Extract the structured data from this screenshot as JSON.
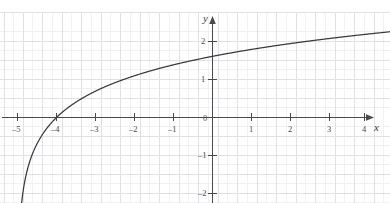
{
  "chart_data": {
    "type": "line",
    "title": "",
    "subtitle": "",
    "xlabel": "x",
    "ylabel": "y",
    "function": "y = ln(x + 5)",
    "xlim": [
      -5.35,
      4.5
    ],
    "ylim": [
      -2.45,
      2.55
    ],
    "xticks": [
      -5,
      -4,
      -3,
      -2,
      -1,
      0,
      1,
      2,
      3,
      4
    ],
    "yticks": [
      2,
      1,
      0,
      -1,
      -2
    ],
    "xtick_labels": [
      "–5",
      "–4",
      "–3",
      "–2",
      "–1",
      "0",
      "1",
      "2",
      "3",
      "4"
    ],
    "ytick_labels": [
      "2",
      "1",
      "0",
      "–1",
      "–2"
    ],
    "grid": true,
    "minor_grid": true,
    "grid_step": 0.5,
    "legend": "none",
    "asymptote_x": -5,
    "x_intercept": -4,
    "y_intercept": 1.61,
    "series": [
      {
        "name": "y = ln(x + 5)",
        "x": [
          -4.94,
          -4.9,
          -4.85,
          -4.8,
          -4.7,
          -4.6,
          -4.5,
          -4.4,
          -4.3,
          -4.2,
          -4.1,
          -4.0,
          -3.8,
          -3.6,
          -3.4,
          -3.2,
          -3.0,
          -2.75,
          -2.5,
          -2.25,
          -2.0,
          -1.75,
          -1.5,
          -1.25,
          -1.0,
          -0.5,
          0.0,
          0.5,
          1.0,
          1.5,
          2.0,
          2.5,
          3.0,
          3.5,
          4.0,
          4.4
        ],
        "y": [
          -2.81,
          -2.3,
          -1.9,
          -1.61,
          -1.2,
          -0.92,
          -0.69,
          -0.51,
          -0.36,
          -0.22,
          -0.11,
          0.0,
          0.18,
          0.34,
          0.47,
          0.59,
          0.69,
          0.81,
          0.92,
          1.01,
          1.1,
          1.18,
          1.25,
          1.32,
          1.39,
          1.5,
          1.61,
          1.7,
          1.79,
          1.87,
          1.95,
          2.01,
          2.08,
          2.14,
          2.2,
          2.24
        ]
      }
    ],
    "colors": {
      "curve": "#3a3a3a",
      "axis": "#4a4a4a",
      "grid_major": "#e2e2e8",
      "grid_minor": "#f0f0f4",
      "background": "#ffffff",
      "label": "#4a4a4a"
    }
  }
}
